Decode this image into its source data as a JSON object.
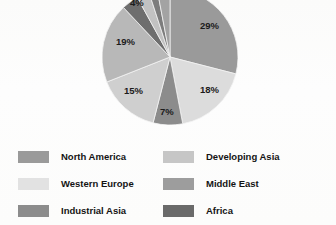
{
  "chart_data": {
    "type": "pie",
    "title": "",
    "subtitle": "",
    "xlabel": "",
    "ylabel": "",
    "legend_position": "bottom",
    "grid": false,
    "note": "Pie is clipped by the top edge of the image; the 4% wedge label is partially cut off.",
    "categories": [
      "North America",
      "Western Europe",
      "Industrial Asia",
      "Developing Asia",
      "Middle East",
      "Africa"
    ],
    "values": [
      29,
      18,
      7,
      15,
      19,
      4
    ],
    "slices": [
      {
        "label": "North America",
        "value": 29,
        "display": "29%",
        "color": "#9a9a9a",
        "start_angle": 0,
        "end_angle": 104.4
      },
      {
        "label": "Western Europe",
        "value": 18,
        "display": "18%",
        "color": "#dcdcdc",
        "start_angle": 104.4,
        "end_angle": 169.2
      },
      {
        "label": "Industrial Asia",
        "value": 7,
        "display": "7%",
        "color": "#8c8c8c",
        "start_angle": 169.2,
        "end_angle": 194.4
      },
      {
        "label": "Developing Asia",
        "value": 15,
        "display": "15%",
        "color": "#cfcfcf",
        "start_angle": 194.4,
        "end_angle": 248.4
      },
      {
        "label": "Middle East",
        "value": 19,
        "display": "19%",
        "color": "#b8b8b8",
        "start_angle": 248.4,
        "end_angle": 316.8
      },
      {
        "label": "Africa",
        "value": 4,
        "display": "4%",
        "color": "#6e6e6e",
        "start_angle": 316.8,
        "end_angle": 331.2
      },
      {
        "label": "",
        "value": 3,
        "display": "",
        "color": "#c2c2c2",
        "start_angle": 331.2,
        "end_angle": 342.0
      },
      {
        "label": "",
        "value": 2,
        "display": "",
        "color": "#7d7d7d",
        "start_angle": 342.0,
        "end_angle": 349.2
      },
      {
        "label": "",
        "value": 3,
        "display": "",
        "color": "#a3a3a3",
        "start_angle": 349.2,
        "end_angle": 360.0
      }
    ],
    "data_labels": [
      {
        "text": "29%"
      },
      {
        "text": "18%"
      },
      {
        "text": "7%"
      },
      {
        "text": "15%"
      },
      {
        "text": "19%"
      },
      {
        "text": "4%"
      }
    ]
  },
  "legend": {
    "left_column": [
      {
        "label": "North America",
        "color": "#9a9a9a"
      },
      {
        "label": "Western Europe",
        "color": "#e2e2e2"
      },
      {
        "label": "Industrial Asia",
        "color": "#8c8c8c"
      }
    ],
    "right_column": [
      {
        "label": "Developing Asia",
        "color": "#c6c6c6"
      },
      {
        "label": "Middle East",
        "color": "#9d9d9d"
      },
      {
        "label": "Africa",
        "color": "#6a6a6a"
      }
    ]
  }
}
